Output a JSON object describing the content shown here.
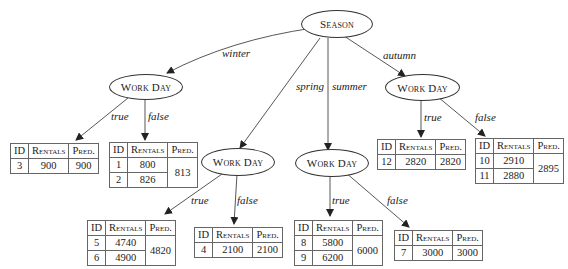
{
  "root": {
    "label": "Season"
  },
  "nodes": {
    "winter": {
      "label": "Work Day"
    },
    "spring": {
      "label": "Work Day"
    },
    "summer": {
      "label": "Work Day"
    },
    "autumn": {
      "label": "Work Day"
    }
  },
  "edge_labels": {
    "winter": "winter",
    "spring": "spring",
    "summer": "summer",
    "autumn": "autumn",
    "true": "true",
    "false": "false"
  },
  "table_headers": {
    "id": "ID",
    "rentals": "Rentals",
    "pred": "Pred."
  },
  "leaves": {
    "winter_true": {
      "rows": [
        {
          "id": "3",
          "rentals": "900"
        }
      ],
      "pred": "900"
    },
    "winter_false": {
      "rows": [
        {
          "id": "1",
          "rentals": "800"
        },
        {
          "id": "2",
          "rentals": "826"
        }
      ],
      "pred": "813"
    },
    "spring_true": {
      "rows": [
        {
          "id": "5",
          "rentals": "4740"
        },
        {
          "id": "6",
          "rentals": "4900"
        }
      ],
      "pred": "4820"
    },
    "spring_false": {
      "rows": [
        {
          "id": "4",
          "rentals": "2100"
        }
      ],
      "pred": "2100"
    },
    "summer_true": {
      "rows": [
        {
          "id": "8",
          "rentals": "5800"
        },
        {
          "id": "9",
          "rentals": "6200"
        }
      ],
      "pred": "6000"
    },
    "summer_false": {
      "rows": [
        {
          "id": "7",
          "rentals": "3000"
        }
      ],
      "pred": "3000"
    },
    "autumn_true": {
      "rows": [
        {
          "id": "12",
          "rentals": "2820"
        }
      ],
      "pred": "2820"
    },
    "autumn_false": {
      "rows": [
        {
          "id": "10",
          "rentals": "2910"
        },
        {
          "id": "11",
          "rentals": "2880"
        }
      ],
      "pred": "2895"
    }
  }
}
